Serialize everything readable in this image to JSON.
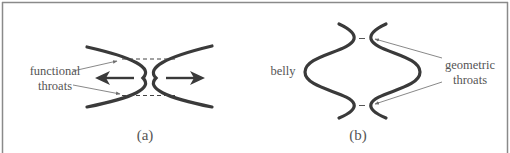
{
  "figure": {
    "panels": [
      {
        "id": "a",
        "caption": "(a)",
        "labels": {
          "line1": "functional",
          "line2": "throats"
        }
      },
      {
        "id": "b",
        "caption": "(b)",
        "labels": {
          "belly": "belly",
          "line1": "geometric",
          "line2": "throats"
        }
      }
    ],
    "colors": {
      "stroke": "#3a3a3a",
      "text": "#555555",
      "border": "#8a8a8a",
      "pointer": "#7a7a7a"
    }
  }
}
